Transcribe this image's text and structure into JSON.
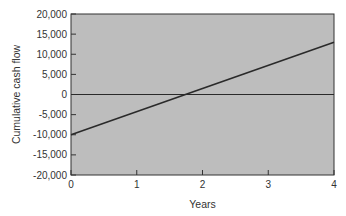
{
  "chart_data": {
    "type": "line",
    "title": "",
    "xlabel": "Years",
    "ylabel": "Cumulative cash flow",
    "xlim": [
      0,
      4
    ],
    "ylim": [
      -20000,
      20000
    ],
    "x_ticks": [
      "0",
      "1",
      "2",
      "3",
      "4"
    ],
    "y_ticks": [
      "20,000",
      "15,000",
      "10,000",
      "5,000",
      "0",
      "-5,000",
      "-10,000",
      "-15,000",
      "-20,000"
    ],
    "grid": false,
    "legend": null,
    "series": [
      {
        "name": "Cumulative cash flow",
        "x": [
          0,
          4
        ],
        "values": [
          -10000,
          13000
        ]
      }
    ],
    "reference_lines": [
      {
        "axis": "y",
        "value": 0
      }
    ],
    "annotations": [
      {
        "text": "Break-even (payback) at ~1.74 years",
        "x": 1.74,
        "y": 0
      }
    ]
  },
  "colors": {
    "plot_background": "#bdbdbd",
    "line": "#2a2a2a",
    "axis": "#333333"
  }
}
